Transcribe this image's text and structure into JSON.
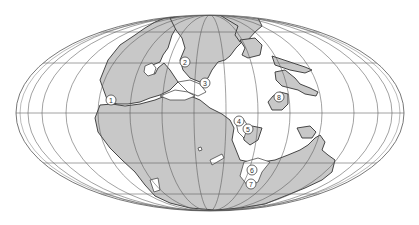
{
  "map": {
    "projection": "Mollweide (elliptical equal-area)",
    "subject": "Paleogeographic reconstruction (supercontinent Pangaea) with numbered localities",
    "colors": {
      "land": "#c8c8c8",
      "ocean": "#ffffff",
      "grid": "#666666",
      "coast": "#333333"
    },
    "localities": [
      {
        "id": "1",
        "label": "1",
        "x": 111,
        "y": 100
      },
      {
        "id": "2",
        "label": "2",
        "x": 185,
        "y": 62
      },
      {
        "id": "3",
        "label": "3",
        "x": 205,
        "y": 83
      },
      {
        "id": "4",
        "label": "4",
        "x": 239,
        "y": 121
      },
      {
        "id": "5",
        "label": "5",
        "x": 248,
        "y": 129
      },
      {
        "id": "6",
        "label": "6",
        "x": 252,
        "y": 170
      },
      {
        "id": "7",
        "label": "7",
        "x": 251,
        "y": 184
      },
      {
        "id": "8",
        "label": "8",
        "x": 279,
        "y": 97
      }
    ]
  }
}
